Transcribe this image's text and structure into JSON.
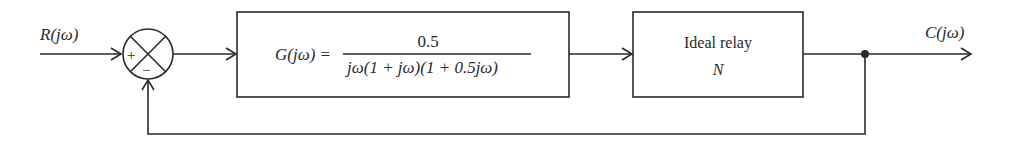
{
  "diagram": {
    "type": "feedback-block-diagram",
    "input": {
      "label": "R(jω)"
    },
    "output": {
      "label": "C(jω)"
    },
    "summing_junction": {
      "plus_sign": "+",
      "minus_sign": "−"
    },
    "blocks": [
      {
        "id": "plant",
        "lhs": "G(jω) =",
        "numerator": "0.5",
        "denominator": "jω(1 + jω)(1 + 0.5jω)"
      },
      {
        "id": "relay",
        "line1": "Ideal relay",
        "line2": "N"
      }
    ],
    "feedback": {
      "sign": "negative",
      "from": "output",
      "to": "summing_junction"
    }
  },
  "colors": {
    "stroke": "#2a2a2a",
    "background": "#ffffff"
  }
}
